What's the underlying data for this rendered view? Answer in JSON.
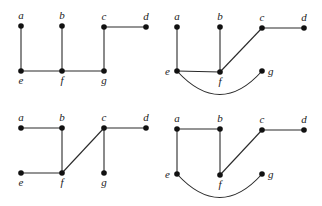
{
  "graphs": [
    {
      "id": "graph-top-left",
      "offset": [
        0,
        0
      ],
      "nodes": [
        {
          "id": "a",
          "x": 21,
          "y": 26,
          "lx": 21,
          "ly": 19,
          "anchor": "middle"
        },
        {
          "id": "b",
          "x": 62,
          "y": 26,
          "lx": 62,
          "ly": 19,
          "anchor": "middle"
        },
        {
          "id": "c",
          "x": 104,
          "y": 27,
          "lx": 104,
          "ly": 20,
          "anchor": "middle"
        },
        {
          "id": "d",
          "x": 146,
          "y": 27,
          "lx": 146,
          "ly": 20,
          "anchor": "middle"
        },
        {
          "id": "e",
          "x": 21,
          "y": 71,
          "lx": 21,
          "ly": 84,
          "anchor": "middle"
        },
        {
          "id": "f",
          "x": 62,
          "y": 71,
          "lx": 62,
          "ly": 84,
          "anchor": "middle"
        },
        {
          "id": "g",
          "x": 104,
          "y": 71,
          "lx": 104,
          "ly": 84,
          "anchor": "middle"
        }
      ],
      "edges": [
        {
          "from": "a",
          "to": "e"
        },
        {
          "from": "b",
          "to": "f"
        },
        {
          "from": "e",
          "to": "f"
        },
        {
          "from": "f",
          "to": "g"
        },
        {
          "from": "g",
          "to": "c"
        },
        {
          "from": "c",
          "to": "d"
        }
      ]
    },
    {
      "id": "graph-top-right",
      "offset": [
        0,
        0
      ],
      "nodes": [
        {
          "id": "a",
          "x": 177,
          "y": 27,
          "lx": 177,
          "ly": 20,
          "anchor": "middle"
        },
        {
          "id": "b",
          "x": 220,
          "y": 27,
          "lx": 220,
          "ly": 20,
          "anchor": "middle"
        },
        {
          "id": "c",
          "x": 262,
          "y": 28,
          "lx": 262,
          "ly": 21,
          "anchor": "middle"
        },
        {
          "id": "d",
          "x": 304,
          "y": 28,
          "lx": 304,
          "ly": 21,
          "anchor": "middle"
        },
        {
          "id": "e",
          "x": 177,
          "y": 71,
          "lx": 170,
          "ly": 75,
          "anchor": "end"
        },
        {
          "id": "f",
          "x": 220,
          "y": 72,
          "lx": 220,
          "ly": 85,
          "anchor": "middle"
        },
        {
          "id": "g",
          "x": 262,
          "y": 71,
          "lx": 268,
          "ly": 75,
          "anchor": "start"
        }
      ],
      "edges": [
        {
          "from": "a",
          "to": "e"
        },
        {
          "from": "b",
          "to": "f"
        },
        {
          "from": "e",
          "to": "f"
        },
        {
          "from": "f",
          "to": "c"
        },
        {
          "from": "c",
          "to": "d"
        },
        {
          "from": "e",
          "to": "g",
          "curve": [
            220,
            118
          ]
        }
      ]
    },
    {
      "id": "graph-bottom-left",
      "offset": [
        0,
        0
      ],
      "nodes": [
        {
          "id": "a",
          "x": 21,
          "y": 128,
          "lx": 21,
          "ly": 121,
          "anchor": "middle"
        },
        {
          "id": "b",
          "x": 62,
          "y": 128,
          "lx": 62,
          "ly": 121,
          "anchor": "middle"
        },
        {
          "id": "c",
          "x": 104,
          "y": 128,
          "lx": 104,
          "ly": 121,
          "anchor": "middle"
        },
        {
          "id": "d",
          "x": 146,
          "y": 128,
          "lx": 146,
          "ly": 121,
          "anchor": "middle"
        },
        {
          "id": "e",
          "x": 21,
          "y": 173,
          "lx": 21,
          "ly": 186,
          "anchor": "middle"
        },
        {
          "id": "f",
          "x": 62,
          "y": 173,
          "lx": 62,
          "ly": 186,
          "anchor": "middle"
        },
        {
          "id": "g",
          "x": 104,
          "y": 173,
          "lx": 104,
          "ly": 186,
          "anchor": "middle"
        }
      ],
      "edges": [
        {
          "from": "a",
          "to": "b"
        },
        {
          "from": "b",
          "to": "f"
        },
        {
          "from": "e",
          "to": "f"
        },
        {
          "from": "f",
          "to": "c"
        },
        {
          "from": "c",
          "to": "d"
        },
        {
          "from": "c",
          "to": "g"
        }
      ]
    },
    {
      "id": "graph-bottom-right",
      "offset": [
        0,
        0
      ],
      "nodes": [
        {
          "id": "a",
          "x": 177,
          "y": 129,
          "lx": 177,
          "ly": 122,
          "anchor": "middle"
        },
        {
          "id": "b",
          "x": 220,
          "y": 129,
          "lx": 220,
          "ly": 122,
          "anchor": "middle"
        },
        {
          "id": "c",
          "x": 262,
          "y": 130,
          "lx": 262,
          "ly": 123,
          "anchor": "middle"
        },
        {
          "id": "d",
          "x": 304,
          "y": 130,
          "lx": 304,
          "ly": 123,
          "anchor": "middle"
        },
        {
          "id": "e",
          "x": 177,
          "y": 174,
          "lx": 170,
          "ly": 178,
          "anchor": "end"
        },
        {
          "id": "f",
          "x": 220,
          "y": 175,
          "lx": 220,
          "ly": 188,
          "anchor": "middle"
        },
        {
          "id": "g",
          "x": 262,
          "y": 174,
          "lx": 268,
          "ly": 178,
          "anchor": "start"
        }
      ],
      "edges": [
        {
          "from": "a",
          "to": "b"
        },
        {
          "from": "a",
          "to": "e"
        },
        {
          "from": "b",
          "to": "f"
        },
        {
          "from": "f",
          "to": "c"
        },
        {
          "from": "c",
          "to": "d"
        },
        {
          "from": "e",
          "to": "g",
          "curve": [
            220,
            221
          ]
        }
      ]
    }
  ]
}
